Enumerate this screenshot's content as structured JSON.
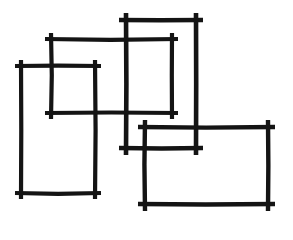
{
  "canvas": {
    "width": 293,
    "height": 240,
    "background_color": "#ffffff",
    "ink_color": "#141414",
    "description": "hand-drawn sketch of four overlapping rectangles"
  },
  "shapes": [
    {
      "name": "rectangle-left-tall",
      "label": "Rectangle 1",
      "x1": 21,
      "y1": 66,
      "x2": 95,
      "y2": 193,
      "stroke_width": 4.2,
      "overshoot": 6
    },
    {
      "name": "rectangle-upper-left-wide",
      "label": "Rectangle 2",
      "x1": 51,
      "y1": 39,
      "x2": 172,
      "y2": 113,
      "stroke_width": 4.2,
      "overshoot": 6
    },
    {
      "name": "rectangle-center-tall",
      "label": "Rectangle 3",
      "x1": 126,
      "y1": 20,
      "x2": 196,
      "y2": 148,
      "stroke_width": 4.6,
      "overshoot": 7
    },
    {
      "name": "rectangle-lower-right-wide",
      "label": "Rectangle 4",
      "x1": 145,
      "y1": 127,
      "x2": 268,
      "y2": 204,
      "stroke_width": 4.4,
      "overshoot": 7
    }
  ]
}
